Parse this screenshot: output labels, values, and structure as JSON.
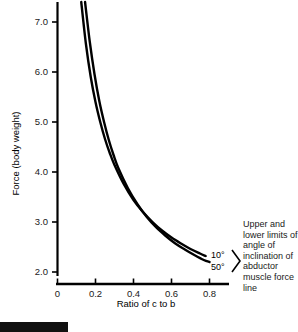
{
  "chart_data": {
    "type": "line",
    "title": "",
    "xlabel": "Ratio of c to b",
    "ylabel": "Force (body weight)",
    "xlim": [
      0,
      0.9
    ],
    "ylim": [
      2.0,
      7.4
    ],
    "xticks": [
      "0",
      "0.2",
      "0.4",
      "0.6",
      "0.8"
    ],
    "xtick_values": [
      0,
      0.2,
      0.4,
      0.6,
      0.8
    ],
    "yticks": [
      "2.0",
      "3.0",
      "4.0",
      "5.0",
      "6.0",
      "7.0"
    ],
    "ytick_values": [
      2.0,
      3.0,
      4.0,
      5.0,
      6.0,
      7.0
    ],
    "grid": false,
    "legend_position": "right-inline",
    "series": [
      {
        "name": "10°",
        "label": "10°",
        "color": "#000000",
        "x": [
          0.125,
          0.15,
          0.175,
          0.2,
          0.225,
          0.25,
          0.275,
          0.3,
          0.35,
          0.4,
          0.45,
          0.5,
          0.55,
          0.6,
          0.65,
          0.7,
          0.75,
          0.78
        ],
        "y": [
          7.4,
          6.55,
          5.9,
          5.4,
          5.0,
          4.66,
          4.38,
          4.14,
          3.75,
          3.44,
          3.2,
          3.0,
          2.83,
          2.69,
          2.57,
          2.46,
          2.37,
          2.32
        ]
      },
      {
        "name": "50°",
        "label": "50°",
        "color": "#000000",
        "x": [
          0.145,
          0.17,
          0.195,
          0.22,
          0.245,
          0.27,
          0.295,
          0.32,
          0.37,
          0.42,
          0.47,
          0.52,
          0.57,
          0.62,
          0.67,
          0.72,
          0.77,
          0.8
        ],
        "y": [
          7.4,
          6.6,
          5.95,
          5.42,
          5.0,
          4.64,
          4.34,
          4.08,
          3.68,
          3.36,
          3.1,
          2.89,
          2.72,
          2.57,
          2.45,
          2.34,
          2.24,
          2.2
        ]
      }
    ],
    "annotations": [
      {
        "name": "bracket-annotation",
        "text": "Upper and lower limits of angle of inclination of abductor muscle force line"
      }
    ]
  },
  "axis": {
    "y_label": "Force (body weight)",
    "x_label": "Ratio of c to b",
    "y_ticks": [
      "7.0",
      "6.0",
      "5.0",
      "4.0",
      "3.0",
      "2.0"
    ],
    "x_ticks": [
      "0",
      "0.2",
      "0.4",
      "0.6",
      "0.8"
    ]
  },
  "curve_labels": {
    "upper": "10°",
    "lower": "50°"
  },
  "annotation": {
    "text": "Upper and lower limits of angle of inclination of abductor muscle force line"
  },
  "colors": {
    "line": "#000000",
    "axis": "#000000",
    "text": "#1a1a1a",
    "background": "#ffffff",
    "bottom_bar": "#111111"
  }
}
